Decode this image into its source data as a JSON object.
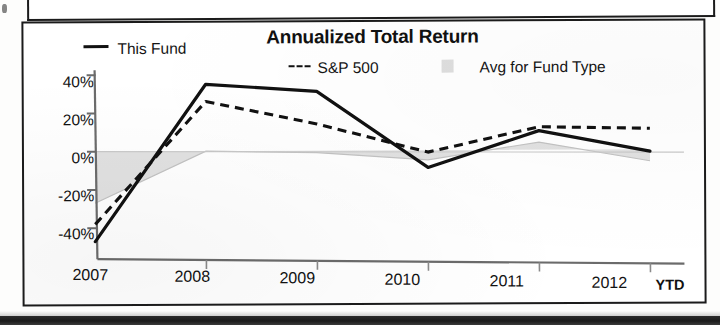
{
  "chart_data": {
    "type": "line",
    "title": "Annualized Total Return",
    "xlabel": "",
    "ylabel": "",
    "categories": [
      "2007",
      "2008",
      "2009",
      "2010",
      "2011",
      "2012"
    ],
    "x_axis_note": "YTD",
    "ylim": [
      -50,
      40
    ],
    "yticks": [
      "40%",
      "20%",
      "0%",
      "-20%",
      "-40%"
    ],
    "ytick_values": [
      40,
      20,
      0,
      -20,
      -40
    ],
    "grid": false,
    "legend_position": "top",
    "series": [
      {
        "name": "This Fund",
        "style": "solid",
        "color": "#111111",
        "values": [
          -47,
          35,
          31,
          -9,
          10,
          -1
        ]
      },
      {
        "name": "S&P 500",
        "style": "dashed",
        "color": "#111111",
        "values": [
          -38,
          26,
          14,
          -1,
          12,
          11
        ]
      },
      {
        "name": "Avg for Fund Type",
        "style": "area",
        "color": "#dedede",
        "values": [
          -27,
          0,
          -1,
          -5,
          4,
          -6
        ]
      }
    ]
  },
  "chart": {
    "title": "Annualized Total Return",
    "legend": [
      {
        "label": "This Fund",
        "marker": "solid-line-swatch"
      },
      {
        "label": "S&P 500",
        "marker": "dashed-line-swatch"
      },
      {
        "label": "Avg for Fund Type",
        "marker": "gray-area-swatch"
      }
    ],
    "y_axis": {
      "ticks": [
        "40%",
        "20%",
        "0%",
        "-20%",
        "-40%"
      ]
    },
    "x_axis": {
      "ticks": [
        "2007",
        "2008",
        "2009",
        "2010",
        "2011",
        "2012"
      ],
      "suffix": "YTD"
    }
  }
}
